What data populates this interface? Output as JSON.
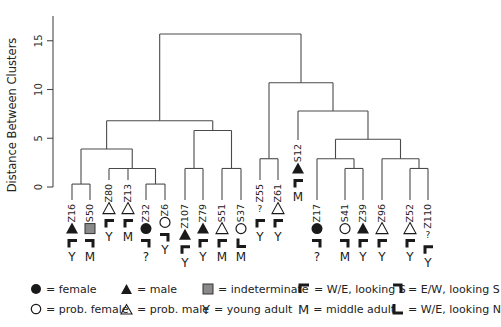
{
  "chart_data": {
    "type": "dendrogram",
    "title": "",
    "ylabel": "Distance Between Clusters",
    "xlabel": "",
    "ylim": [
      0,
      17
    ],
    "yticks": [
      0,
      5,
      10,
      15
    ],
    "grid": false,
    "leaves": [
      {
        "id": "Z16",
        "sex": "male",
        "orientation": "W/E, looking S",
        "age": "Y"
      },
      {
        "id": "S50",
        "sex": "indeterminate",
        "orientation": "E/W, looking S",
        "age": "M"
      },
      {
        "id": "Z80",
        "sex": "prob. male",
        "orientation": "W/E, looking S",
        "age": "Y"
      },
      {
        "id": "Z13",
        "sex": "prob. male",
        "orientation": "W/E, looking S",
        "age": "M"
      },
      {
        "id": "Z32",
        "sex": "female",
        "orientation": "E/W, looking S",
        "age": "?"
      },
      {
        "id": "Z6",
        "sex": "prob. female",
        "orientation": "E/W, looking S",
        "age": "Y"
      },
      {
        "id": "Z107",
        "sex": "male",
        "orientation": "W/E, looking S",
        "age": "Y"
      },
      {
        "id": "Z79",
        "sex": "male",
        "orientation": "W/E, looking S",
        "age": "Y"
      },
      {
        "id": "S51",
        "sex": "prob. male",
        "orientation": "W/E, looking S",
        "age": "M"
      },
      {
        "id": "S37",
        "sex": "prob. female",
        "orientation": "W/E, looking N",
        "age": "M"
      },
      {
        "id": "Z55",
        "sex": "?",
        "orientation": "W/E, looking S",
        "age": "Y"
      },
      {
        "id": "Z61",
        "sex": "prob. male",
        "orientation": "W/E, looking S",
        "age": "Y"
      },
      {
        "id": "S12",
        "sex": "male",
        "orientation": "W/E, looking S",
        "age": "M"
      },
      {
        "id": "Z17",
        "sex": "female",
        "orientation": "E/W, looking S",
        "age": "?"
      },
      {
        "id": "S41",
        "sex": "prob. female",
        "orientation": "E/W, looking S",
        "age": "M"
      },
      {
        "id": "Z39",
        "sex": "male",
        "orientation": "W/E, looking S",
        "age": "Y"
      },
      {
        "id": "Z96",
        "sex": "prob. male",
        "orientation": "W/E, looking S",
        "age": "Y"
      },
      {
        "id": "Z52",
        "sex": "prob. male",
        "orientation": "W/E, looking S",
        "age": "Y"
      },
      {
        "id": "Z110",
        "sex": "?",
        "orientation": "W/E, looking S",
        "age": "Y"
      }
    ],
    "merges": [
      {
        "left": "Z16",
        "right": "S50",
        "height": 0.3
      },
      {
        "left": "Z32",
        "right": "Z6",
        "height": 0.3
      },
      {
        "left": "Z80",
        "right": [
          "Z13",
          "Z32+Z6"
        ],
        "height": 1.9
      },
      {
        "left": "Z16+S50",
        "right": "Z80+Z13+Z32+Z6",
        "height": 3.9
      },
      {
        "left": "Z107",
        "right": "Z79",
        "height": 1.9
      },
      {
        "left": "S51",
        "right": "S37",
        "height": 1.9
      },
      {
        "left": "Z107+Z79",
        "right": "S51+S37",
        "height": 5.8
      },
      {
        "left": "Group A",
        "right": "Group B",
        "height": 6.8
      },
      {
        "left": "Z55",
        "right": "Z61",
        "height": 2.9
      },
      {
        "left": "S41",
        "right": "Z39",
        "height": 1.9
      },
      {
        "left": "Z17",
        "right": "S41+Z39",
        "height": 2.9
      },
      {
        "left": "Z52",
        "right": "Z110",
        "height": 1.9
      },
      {
        "left": "Z96",
        "right": "Z52+Z110",
        "height": 2.9
      },
      {
        "left": "Z17 cluster",
        "right": "Z96 cluster",
        "height": 4.9
      },
      {
        "left": "S12",
        "right": "Z17..Z110",
        "height": 7.8
      },
      {
        "left": "Z55+Z61",
        "right": "S12..Z110",
        "height": 10.7
      },
      {
        "left": "Left clade",
        "right": "Right clade",
        "height": 15.7
      }
    ]
  },
  "legend": {
    "row1": [
      {
        "symbol": "filled-circle",
        "label": "= female"
      },
      {
        "symbol": "filled-triangle",
        "label": "= male"
      },
      {
        "symbol": "gray-square",
        "label": "= indeterminate"
      },
      {
        "symbol": "bracket-we-s",
        "label": "= W/E, looking S"
      },
      {
        "symbol": "bracket-ew-s",
        "label": "= E/W, looking S"
      }
    ],
    "row2": [
      {
        "symbol": "open-circle",
        "label": "= prob. female"
      },
      {
        "symbol": "open-triangle",
        "label": "= prob. male"
      },
      {
        "symbol": "Y",
        "label": "= young adult"
      },
      {
        "symbol": "M",
        "label": "= middle adult"
      },
      {
        "symbol": "bracket-we-n",
        "label": "= W/E, looking N"
      }
    ]
  },
  "colors": {
    "line": "#4a4a4a",
    "symbol": "#1a1a1a",
    "indeterminate": "#8a8a8a"
  }
}
